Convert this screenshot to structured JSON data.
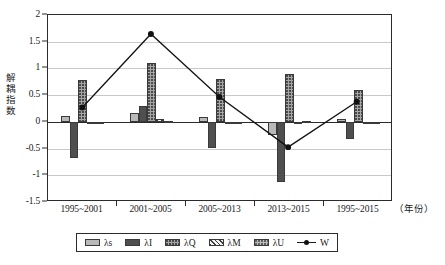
{
  "chart_data": {
    "type": "bar",
    "title": "",
    "xlabel": "（年份）",
    "ylabel": "解耦指数",
    "ylim": [
      -1.5,
      2
    ],
    "ytick_labels": [
      "2",
      "1.5",
      "1",
      "0.5",
      "0",
      "-0.5",
      "-1",
      "-1.5"
    ],
    "ytick_values": [
      2,
      1.5,
      1,
      0.5,
      0,
      -0.5,
      -1,
      -1.5
    ],
    "grid": true,
    "legend_position": "bottom",
    "categories": [
      "1995~2001",
      "2001~2005",
      "2005~2013",
      "2013~2015",
      "1995~2015"
    ],
    "series": [
      {
        "name": "λs",
        "type": "bar",
        "key": "ls",
        "values": [
          0.11,
          0.17,
          0.1,
          -0.25,
          0.05
        ]
      },
      {
        "name": "λI",
        "type": "bar",
        "key": "li",
        "values": [
          -0.67,
          0.3,
          -0.48,
          -1.12,
          -0.33
        ]
      },
      {
        "name": "λQ",
        "type": "bar",
        "key": "lq",
        "values": [
          0.79,
          1.11,
          0.81,
          0.9,
          0.6
        ]
      },
      {
        "name": "λM",
        "type": "bar",
        "key": "lm",
        "values": [
          -0.02,
          0.06,
          -0.01,
          -0.03,
          -0.01
        ]
      },
      {
        "name": "λU",
        "type": "bar",
        "key": "lu",
        "values": [
          -0.01,
          0.01,
          0.0,
          0.02,
          -0.02
        ]
      },
      {
        "name": "W",
        "type": "line",
        "key": "w",
        "values": [
          0.25,
          1.64,
          0.45,
          -0.5,
          0.36
        ]
      }
    ]
  },
  "legend": {
    "items": [
      {
        "label": "λs",
        "swatch": "ls"
      },
      {
        "label": "λI",
        "swatch": "li"
      },
      {
        "label": "λQ",
        "swatch": "lq"
      },
      {
        "label": "λM",
        "swatch": "lm"
      },
      {
        "label": "λU",
        "swatch": "lu"
      },
      {
        "label": "W",
        "swatch": "line"
      }
    ]
  },
  "colors": {
    "axis": "#2b2b2b",
    "grid": "#c9c9c9",
    "ls": "#b9b9b9",
    "li": "#4f4f4f",
    "lq": "#a5a5a5",
    "lm": "#f2f2f2",
    "lu": "#bdbdbd",
    "line": "#111111"
  }
}
